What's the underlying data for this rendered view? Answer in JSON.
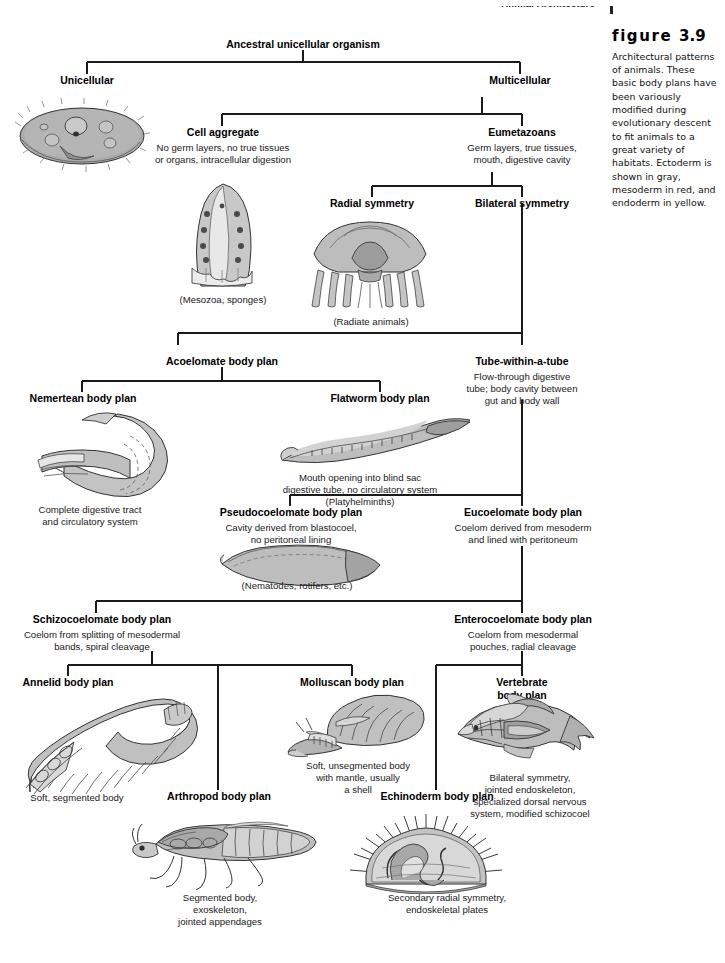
{
  "running_head": {
    "title": "Animal Architecture",
    "page_number": "61",
    "rule": "vertical-rule"
  },
  "caption": {
    "label_word": "figure",
    "number": "3.9",
    "text": "Architectural patterns of animals. These basic body plans have been variously modified during evolutionary descent to fit animals to a great variety of habitats. Ectoderm is shown in gray, mesoderm in red, and endoderm in yellow."
  },
  "nodes": {
    "ancestral": {
      "title": "Ancestral unicellular organism",
      "sub": ""
    },
    "unicellular": {
      "title": "Unicellular",
      "sub": ""
    },
    "multicellular": {
      "title": "Multicellular",
      "sub": ""
    },
    "cell_aggregate": {
      "title": "Cell aggregate",
      "sub": "No germ layers, no true tissues\nor organs, intracellular digestion"
    },
    "eumetazoans": {
      "title": "Eumetazoans",
      "sub": "Germ layers, true tissues,\nmouth, digestive cavity"
    },
    "radial": {
      "title": "Radial symmetry",
      "sub": ""
    },
    "bilateral": {
      "title": "Bilateral symmetry",
      "sub": ""
    },
    "acoelomate": {
      "title": "Acoelomate body plan",
      "sub": ""
    },
    "tube": {
      "title": "Tube-within-a-tube",
      "sub": "Flow-through digestive\ntube; body cavity between\ngut and body wall"
    },
    "nemertean": {
      "title": "Nemertean body plan",
      "sub": ""
    },
    "flatworm": {
      "title": "Flatworm body plan",
      "sub": ""
    },
    "pseudocoelomate": {
      "title": "Pseudocoelomate body plan",
      "sub": "Cavity derived from blastocoel,\nno peritoneal lining"
    },
    "eucoelomate": {
      "title": "Eucoelomate body plan",
      "sub": "Coelom derived from mesoderm\nand lined with peritoneum"
    },
    "schizocoelomate": {
      "title": "Schizocoelomate body plan",
      "sub": "Coelom from splitting of mesodermal\nbands, spiral cleavage"
    },
    "enterocoelomate": {
      "title": "Enterocoelomate body plan",
      "sub": "Coelom from mesodermal\npouches, radial cleavage"
    },
    "annelid": {
      "title": "Annelid body plan",
      "sub": ""
    },
    "molluscan": {
      "title": "Molluscan body plan",
      "sub": ""
    },
    "vertebrate": {
      "title": "Vertebrate\nbody plan",
      "sub": ""
    },
    "arthropod": {
      "title": "Arthropod body plan",
      "sub": ""
    },
    "echinoderm": {
      "title": "Echinoderm body plan",
      "sub": ""
    }
  },
  "captions_under_art": {
    "mesozoa": "(Mesozoa, sponges)",
    "radiate": "(Radiate animals)",
    "nemertean": "Complete digestive tract\nand circulatory system",
    "flatworm": "Mouth opening into blind sac\ndigestive tube, no circulatory system\n(Platyhelminths)",
    "nematodes": "(Nematodes, rotifers, etc.)",
    "annelid": "Soft, segmented body",
    "molluscan": "Soft, unsegmented body\nwith mantle, usually\na shell",
    "vertebrate": "Bilateral symmetry,\njointed endoskeleton,\nspecialized dorsal nervous\nsystem, modified schizocoel",
    "arthropod": "Segmented body,\nexoskeleton,\njointed appendages",
    "echinoderm": "Secondary radial symmetry,\nendoskeletal plates"
  },
  "artwork": {
    "protozoan": "protozoan-illustration",
    "sponge": "sponge-illustration",
    "jellyfish": "jellyfish-illustration",
    "nemertean": "nemertean-worm-illustration",
    "flatworm": "flatworm-illustration",
    "nematode": "nematode-illustration",
    "earthworm": "annelid-earthworm-illustration",
    "snail": "mollusc-snail-illustration",
    "fish": "vertebrate-fish-illustration",
    "insect": "arthropod-insect-illustration",
    "urchin": "echinoderm-urchin-illustration"
  },
  "colors": {
    "ink": "#111111",
    "line": "#1a1a1a",
    "ectoderm_gray": "#9a9a9a",
    "body_fill": "#b9b9b9",
    "light_fill": "#dcdcdc",
    "white": "#ffffff"
  }
}
